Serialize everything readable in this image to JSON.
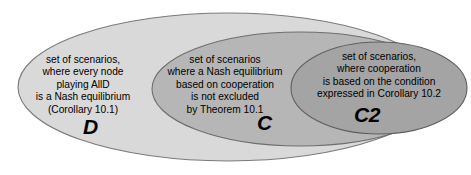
{
  "diagram": {
    "background_color": "#ffffff",
    "sets": [
      {
        "id": "D",
        "label": "D",
        "fill_color": "#d9d9d9",
        "stroke_color": "#7a7a7a",
        "lines": [
          "set of scenarios,",
          "where every node",
          "playing AllD",
          "is a Nash equilibrium",
          "(Corollary 10.1)"
        ],
        "text": "set of scenarios, where every node playing AllD is a Nash equilibrium (Corollary 10.1)"
      },
      {
        "id": "C",
        "label": "C",
        "fill_color": "#b6b6b6",
        "stroke_color": "#6e6e6e",
        "lines": [
          "set of scenarios",
          "where a Nash equilibrium",
          "based on cooperation",
          "is not excluded",
          "by Theorem 10.1"
        ],
        "text": "set of scenarios where a Nash equilibrium based on cooperation is not excluded by Theorem 10.1"
      },
      {
        "id": "C2",
        "label": "C2",
        "fill_color": "#a4a4a4",
        "stroke_color": "#5f5f5f",
        "lines": [
          "set of scenarios,",
          "where cooperation",
          "is based on the condition",
          "expressed in Corollary 10.2"
        ],
        "text": "set of scenarios, where cooperation is based on the condition expressed in Corollary 10.2"
      }
    ]
  }
}
